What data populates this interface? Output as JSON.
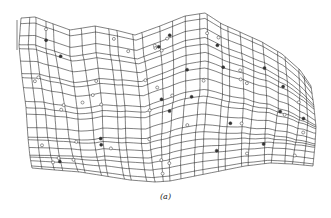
{
  "figure": {
    "caption": "(a)",
    "line_color": "#1a1a1a",
    "point_color": "#333333",
    "grid": {
      "rows": 20,
      "cols": 26
    },
    "data_point_count": 62
  }
}
